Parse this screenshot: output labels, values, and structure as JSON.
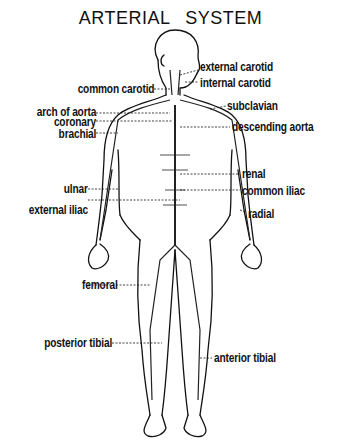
{
  "title": "ARTERIAL SYSTEM",
  "labels": {
    "external_carotid": "external carotid",
    "internal_carotid": "internal carotid",
    "common_carotid": "common carotid",
    "subclavian": "subclavian",
    "arch_of_aorta": "arch of aorta",
    "descending_aorta": "descending aorta",
    "coronary": "coronary",
    "brachial": "brachial",
    "renal": "renal",
    "ulnar": "ulnar",
    "common_iliac": "common iliac",
    "external_iliac": "external iliac",
    "radial": "radial",
    "femoral": "femoral",
    "posterior_tibial": "posterior tibial",
    "anterior_tibial": "anterior tibial"
  }
}
